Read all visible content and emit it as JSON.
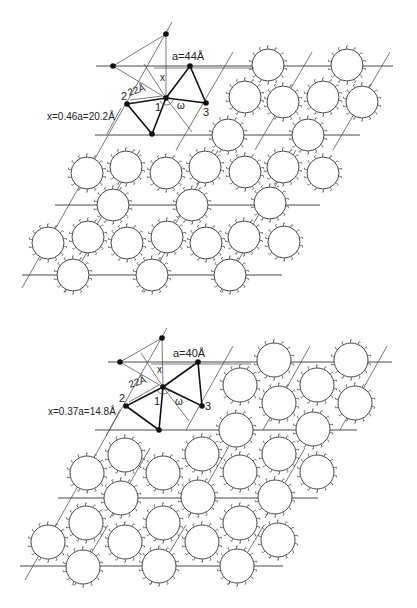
{
  "figure": {
    "panels": [
      {
        "id": "top",
        "labels": {
          "lattice_constant": "a=44Å",
          "distance": "22Å",
          "offset": "x=0.46a=20.2Å",
          "x_symbol": "x",
          "omega": "ω",
          "point_1": "1",
          "point_2": "2",
          "point_3": "3"
        },
        "label_positions": {
          "lattice_constant": [
            172,
            60
          ],
          "distance": [
            129,
            96
          ],
          "offset": [
            47,
            120
          ],
          "x_symbol": [
            160,
            81
          ],
          "omega": [
            177,
            109
          ],
          "point_1": [
            155,
            111
          ],
          "point_2": [
            121,
            100
          ],
          "point_3": [
            203,
            116
          ]
        },
        "points": {
          "top": [
            166,
            34
          ],
          "left": [
            113,
            66
          ],
          "right_top": [
            190,
            66
          ],
          "center_1": [
            166,
            98
          ],
          "p2": [
            127,
            104
          ],
          "p3": [
            206,
            103
          ],
          "bottom": [
            152,
            134
          ]
        },
        "hlines": [
          {
            "y": 66,
            "x1": 96,
            "x2": 393
          },
          {
            "y": 135,
            "x1": 95,
            "x2": 360
          },
          {
            "y": 205,
            "x1": 55,
            "x2": 320
          },
          {
            "y": 275,
            "x1": 22,
            "x2": 282
          }
        ],
        "slants": [
          {
            "x1": 172,
            "y1": 22,
            "x2": 22,
            "y2": 288
          },
          {
            "x1": 233,
            "y1": 52,
            "x2": 176,
            "y2": 150
          },
          {
            "x1": 312,
            "y1": 52,
            "x2": 255,
            "y2": 150
          },
          {
            "x1": 390,
            "y1": 52,
            "x2": 333,
            "y2": 150
          },
          {
            "x1": 140,
            "y1": 150,
            "x2": 95,
            "y2": 228
          },
          {
            "x1": 218,
            "y1": 150,
            "x2": 173,
            "y2": 228
          },
          {
            "x1": 296,
            "y1": 150,
            "x2": 251,
            "y2": 228
          },
          {
            "x1": 100,
            "y1": 230,
            "x2": 64,
            "y2": 292
          },
          {
            "x1": 178,
            "y1": 230,
            "x2": 142,
            "y2": 292
          },
          {
            "x1": 256,
            "y1": 230,
            "x2": 220,
            "y2": 292
          }
        ],
        "circle_radius": 16,
        "circles": [
          [
            268,
            65
          ],
          [
            347,
            65
          ],
          [
            245,
            97
          ],
          [
            283,
            102
          ],
          [
            323,
            97
          ],
          [
            362,
            102
          ],
          [
            228,
            135
          ],
          [
            308,
            135
          ],
          [
            87,
            173
          ],
          [
            126,
            167
          ],
          [
            166,
            173
          ],
          [
            205,
            167
          ],
          [
            245,
            172
          ],
          [
            283,
            167
          ],
          [
            323,
            173
          ],
          [
            113,
            205
          ],
          [
            192,
            205
          ],
          [
            270,
            203
          ],
          [
            48,
            243
          ],
          [
            88,
            237
          ],
          [
            127,
            243
          ],
          [
            167,
            237
          ],
          [
            206,
            243
          ],
          [
            244,
            237
          ],
          [
            284,
            242
          ],
          [
            73,
            275
          ],
          [
            152,
            275
          ],
          [
            230,
            275
          ]
        ]
      },
      {
        "id": "bottom",
        "labels": {
          "lattice_constant": "a=40Å",
          "distance": "22Å",
          "offset": "x=0.37a=14.8Å",
          "x_symbol": "x",
          "omega": "ω",
          "point_1": "1",
          "point_2": "2",
          "point_3": "3"
        },
        "label_positions": {
          "lattice_constant": [
            173,
            357
          ],
          "distance": [
            130,
            388
          ],
          "offset": [
            48,
            415
          ],
          "x_symbol": [
            157,
            373
          ],
          "omega": [
            175,
            405
          ],
          "point_1": [
            154,
            405
          ],
          "point_2": [
            119,
            402
          ],
          "point_3": [
            205,
            410
          ]
        },
        "points": {
          "top": [
            162,
            338
          ],
          "left": [
            120,
            362
          ],
          "right_top": [
            198,
            362
          ],
          "center_1": [
            163,
            387
          ],
          "p2": [
            126,
            406
          ],
          "p3": [
            202,
            406
          ],
          "bottom": [
            159,
            430
          ]
        },
        "hlines": [
          {
            "y": 362,
            "x1": 108,
            "x2": 392
          },
          {
            "y": 430,
            "x1": 95,
            "x2": 357
          },
          {
            "y": 498,
            "x1": 58,
            "x2": 318
          },
          {
            "y": 566,
            "x1": 20,
            "x2": 283
          }
        ],
        "slants": [
          {
            "x1": 167,
            "y1": 328,
            "x2": 25,
            "y2": 580
          },
          {
            "x1": 233,
            "y1": 346,
            "x2": 186,
            "y2": 430
          },
          {
            "x1": 310,
            "y1": 346,
            "x2": 263,
            "y2": 430
          },
          {
            "x1": 387,
            "y1": 346,
            "x2": 340,
            "y2": 430
          },
          {
            "x1": 150,
            "y1": 448,
            "x2": 110,
            "y2": 518
          },
          {
            "x1": 228,
            "y1": 448,
            "x2": 188,
            "y2": 518
          },
          {
            "x1": 305,
            "y1": 448,
            "x2": 265,
            "y2": 518
          },
          {
            "x1": 108,
            "y1": 525,
            "x2": 72,
            "y2": 585
          },
          {
            "x1": 186,
            "y1": 525,
            "x2": 150,
            "y2": 585
          },
          {
            "x1": 264,
            "y1": 525,
            "x2": 228,
            "y2": 585
          }
        ],
        "circle_radius": 17,
        "circles": [
          [
            274,
            360
          ],
          [
            351,
            360
          ],
          [
            240,
            385
          ],
          [
            317,
            385
          ],
          [
            279,
            403
          ],
          [
            355,
            403
          ],
          [
            236,
            430
          ],
          [
            313,
            429
          ],
          [
            125,
            455
          ],
          [
            202,
            454
          ],
          [
            279,
            454
          ],
          [
            87,
            473
          ],
          [
            163,
            473
          ],
          [
            240,
            472
          ],
          [
            317,
            472
          ],
          [
            121,
            498
          ],
          [
            198,
            497
          ],
          [
            275,
            497
          ],
          [
            86,
            523
          ],
          [
            163,
            523
          ],
          [
            240,
            523
          ],
          [
            48,
            542
          ],
          [
            125,
            542
          ],
          [
            202,
            542
          ],
          [
            278,
            540
          ],
          [
            83,
            567
          ],
          [
            159,
            566
          ],
          [
            237,
            566
          ]
        ]
      }
    ]
  }
}
